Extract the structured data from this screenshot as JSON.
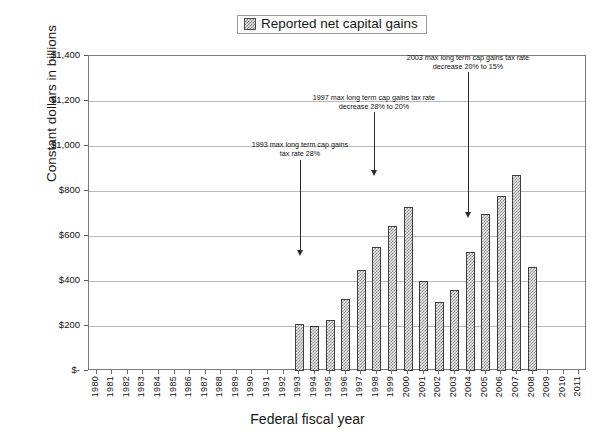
{
  "legend": {
    "entries": [
      {
        "label": "Reported net capital gains",
        "swatch": "hatched-pattern-swatch"
      }
    ]
  },
  "axes": {
    "y_title": "Constant dollars in billions",
    "x_title": "Federal fiscal year",
    "y_tick_labels": [
      "$1,400",
      "$1,200",
      "$1,000",
      "$800",
      "$600",
      "$400",
      "$200",
      "$-"
    ],
    "y_tick_values": [
      1400,
      1200,
      1000,
      800,
      600,
      400,
      200,
      0
    ]
  },
  "annotations": [
    {
      "id": "annotation-1993",
      "line1": "1993 max long term cap gains",
      "line2": "tax rate 28%",
      "target_year": "1993"
    },
    {
      "id": "annotation-1997",
      "line1": "1997 max long term cap gains tax rate",
      "line2": "decrease 28% to 20%",
      "target_year": "1998"
    },
    {
      "id": "annotation-2003",
      "line1": "2003 max long term cap gains tax rate",
      "line2": "decrease 20% to 15%",
      "target_year": "2003"
    }
  ],
  "chart_data": {
    "type": "bar",
    "title": "",
    "xlabel": "Federal fiscal year",
    "ylabel": "Constant dollars in billions",
    "ylim": [
      0,
      1400
    ],
    "ytick_step": 200,
    "grid": true,
    "legend_position": "top-center",
    "series_name": "Reported net capital gains",
    "categories": [
      "1980",
      "1981",
      "1982",
      "1983",
      "1984",
      "1985",
      "1986",
      "1987",
      "1988",
      "1989",
      "1990",
      "1991",
      "1992",
      "1993",
      "1994",
      "1995",
      "1996",
      "1997",
      "1998",
      "1999",
      "2000",
      "2001",
      "2002",
      "2003",
      "2004",
      "2005",
      "2006",
      "2007",
      "2008",
      "2009",
      "2010",
      "2011"
    ],
    "values": [
      null,
      null,
      null,
      null,
      null,
      null,
      null,
      null,
      null,
      null,
      null,
      null,
      null,
      207,
      202,
      228,
      320,
      447,
      550,
      643,
      727,
      400,
      307,
      360,
      530,
      698,
      780,
      872,
      463,
      null,
      null,
      null
    ],
    "annotations": [
      {
        "text": "1993 max long term cap gains tax rate 28%",
        "points_to": "1993"
      },
      {
        "text": "1997 max long term cap gains tax rate decrease 28% to 20%",
        "points_to": "1998"
      },
      {
        "text": "2003 max long term cap gains tax rate decrease 20% to 15%",
        "points_to": "2003"
      }
    ]
  },
  "colors": {
    "bar_fill": "#ebebeb",
    "bar_pattern": "#8a8a8a",
    "bar_border": "#3d3d3d",
    "gridline": "#b9b9b9",
    "axis": "#7a7a7a",
    "text": "#161616"
  }
}
